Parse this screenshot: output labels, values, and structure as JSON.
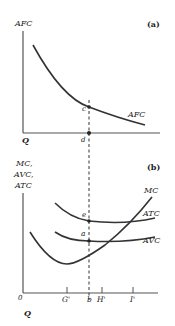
{
  "panel_a": {
    "tag": "(a)",
    "y_axis_label": "AFC",
    "x_axis_label": "Q",
    "curve_label": "AFC",
    "point_c": "c",
    "point_d": "d"
  },
  "panel_b": {
    "tag": "(b)",
    "y_axis_label_lines": [
      "MC,",
      "AVC,",
      "ATC"
    ],
    "x_axis_label": "Q",
    "origin": "0",
    "curve_labels": {
      "mc": "MC",
      "atc": "ATC",
      "avc": "AVC"
    },
    "point_e": "e",
    "point_a": "a",
    "ticks": [
      "G'",
      "b",
      "H'",
      "I'"
    ]
  },
  "colors": {
    "ink": "#333333",
    "axis": "#555555",
    "background": "#ffffff"
  }
}
